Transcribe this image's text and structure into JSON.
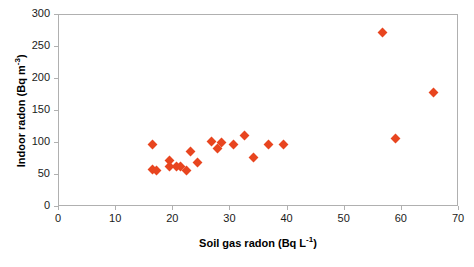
{
  "chart_data": {
    "type": "scatter",
    "title": "",
    "xlabel": "Soil gas radon (Bq L⁻¹)",
    "ylabel": "Indoor radon (Bq m⁻³)",
    "xlabel_plain": "Soil gas radon",
    "xlabel_unit": "Bq L",
    "xlabel_unit_exp": "-1",
    "ylabel_plain": "Indoor radon",
    "ylabel_unit": "Bq m",
    "ylabel_unit_exp": "-3",
    "xlim": [
      0,
      70
    ],
    "ylim": [
      0,
      300
    ],
    "xticks": [
      0,
      10,
      20,
      30,
      40,
      50,
      60,
      70
    ],
    "yticks": [
      0,
      50,
      100,
      150,
      200,
      250,
      300
    ],
    "grid": false,
    "legend": false,
    "marker": "diamond",
    "marker_color": "#e8451f",
    "axis_color": "#b0b0b0",
    "series": [
      {
        "name": "Paired radon measurements",
        "points": [
          {
            "x": 16.3,
            "y": 97
          },
          {
            "x": 16.4,
            "y": 58
          },
          {
            "x": 17.0,
            "y": 57
          },
          {
            "x": 19.3,
            "y": 64
          },
          {
            "x": 19.3,
            "y": 73
          },
          {
            "x": 20.5,
            "y": 63
          },
          {
            "x": 21.2,
            "y": 63
          },
          {
            "x": 22.3,
            "y": 57
          },
          {
            "x": 23.0,
            "y": 86
          },
          {
            "x": 24.2,
            "y": 69
          },
          {
            "x": 26.7,
            "y": 102
          },
          {
            "x": 27.7,
            "y": 91
          },
          {
            "x": 28.4,
            "y": 101
          },
          {
            "x": 30.6,
            "y": 97
          },
          {
            "x": 32.5,
            "y": 112
          },
          {
            "x": 34.0,
            "y": 77
          },
          {
            "x": 36.6,
            "y": 98
          },
          {
            "x": 39.3,
            "y": 97
          },
          {
            "x": 56.6,
            "y": 273
          },
          {
            "x": 58.8,
            "y": 107
          },
          {
            "x": 65.6,
            "y": 179
          }
        ]
      }
    ]
  }
}
